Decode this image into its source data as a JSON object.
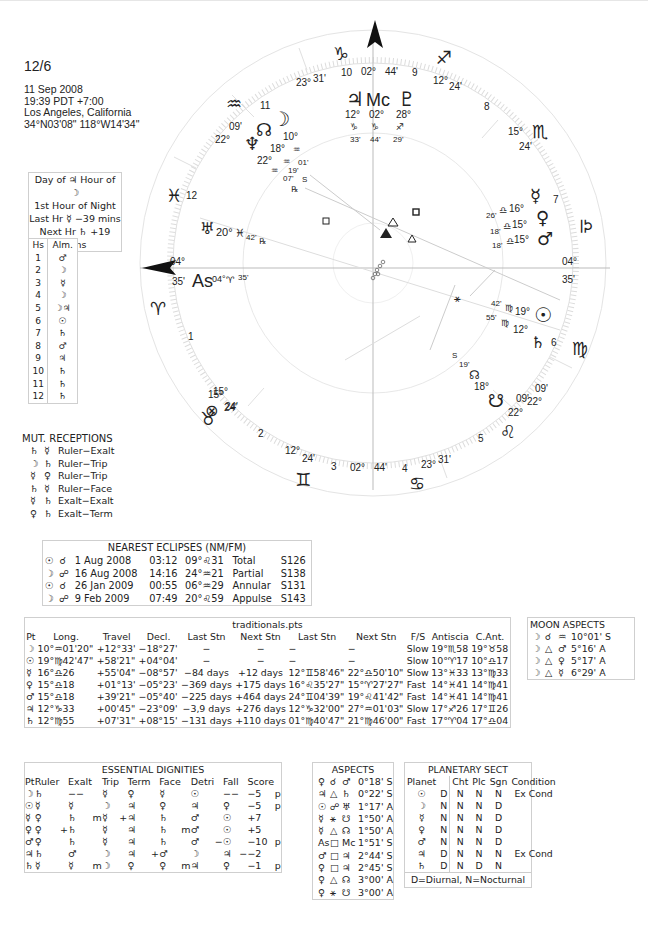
{
  "header": {
    "title": "12/6",
    "date": "11 Sep 2008",
    "time": "19:39  PDT +7:00",
    "place": "Los Angeles, California",
    "coords": "34°N03'08\" 118°W14'34\""
  },
  "planetary_hours": {
    "line1": "Day of ♃  Hour of ☽",
    "line2": "1st Hour of Night",
    "line3": "Last Hr ☿ −39 mins",
    "line4": "Next Hr ♄ +19 mins"
  },
  "almuten": {
    "headers": [
      "Hs",
      "Alm."
    ],
    "rows": [
      [
        "1",
        "♂"
      ],
      [
        "2",
        "☽"
      ],
      [
        "3",
        "☿"
      ],
      [
        "4",
        "☽"
      ],
      [
        "5",
        "☽♃"
      ],
      [
        "6",
        "☉"
      ],
      [
        "7",
        "♄"
      ],
      [
        "8",
        "♂"
      ],
      [
        "9",
        "♃"
      ],
      [
        "10",
        "♄"
      ],
      [
        "11",
        "♄"
      ],
      [
        "12",
        "♄"
      ]
    ]
  },
  "mutual_receptions": {
    "title": "MUT. RECEPTIONS",
    "rows": [
      [
        "♄",
        "☿",
        "Ruler−Exalt"
      ],
      [
        "☽",
        "♄",
        "Ruler−Trip"
      ],
      [
        "☿",
        "♀",
        "Ruler−Trip"
      ],
      [
        "♄",
        "☿",
        "Ruler−Face"
      ],
      [
        "☿",
        "♄",
        "Exalt−Exalt"
      ],
      [
        "♀",
        "♄",
        "Exalt−Term"
      ]
    ]
  },
  "eclipses": {
    "title": "NEAREST ECLIPSES (NM/FM)",
    "rows": [
      [
        "☉",
        "☌",
        "1 Aug 2008",
        "03:12",
        "09°♌31",
        "Total",
        "S126"
      ],
      [
        "☽",
        "☍",
        "16 Aug 2008",
        "14:16",
        "24°♒21",
        "Partial",
        "S138"
      ],
      [
        "☉",
        "☌",
        "26 Jan 2009",
        "00:55",
        "06°♒29",
        "Annular",
        "S131"
      ],
      [
        "☽",
        "☍",
        "9 Feb 2009",
        "07:49",
        "20°♌59",
        "Appulse",
        "S143"
      ]
    ]
  },
  "traditionals": {
    "title": "traditionals.pts",
    "headers": [
      "Pt",
      "Long.",
      "Travel",
      "Decl.",
      "Last Stn",
      "Next Stn",
      "Last Stn",
      "Next Stn",
      "F/S",
      "Antiscia",
      "C.Ant."
    ],
    "rows": [
      [
        "☽",
        "10°♒01'20\"",
        "+12°33'",
        "−18°27'",
        "−",
        "−",
        "−",
        "−",
        "Slow",
        "19°♏58",
        "19°♉58"
      ],
      [
        "☉",
        "19°♍42'47\"",
        "+58'21\"",
        "+04°04'",
        "−",
        "−",
        "−",
        "−",
        "Slow",
        "10°♈17",
        "10°♎17"
      ],
      [
        "☿",
        "16°♎26",
        "+55'04\"",
        "−08°57'",
        "−84 days",
        "+12 days",
        "12°♊58'46\"",
        "22°♎50'10\"",
        "Slow",
        "13°♓33",
        "13°♍33"
      ],
      [
        "♀",
        "15°♎18",
        "+01°13'",
        "−05°23'",
        "−369 days",
        "+175 days",
        "16°♌35'27\"",
        "15°♈27'27\"",
        "Fast",
        "14°♓41",
        "14°♍41"
      ],
      [
        "♂",
        "15°♎18",
        "+39'21\"",
        "−05°40'",
        "−225 days",
        "+464 days",
        "24°♊04'39\"",
        "19°♌41'42\"",
        "Fast",
        "14°♓41",
        "14°♍41"
      ],
      [
        "♃",
        "12°♑33",
        "+00'45\"",
        "−23°09'",
        "−3,9 days",
        "+276 days",
        "12°♑32'00\"",
        "27°♒01'03\"",
        "Slow",
        "17°♐26",
        "17°♊26"
      ],
      [
        "♄",
        "12°♍55",
        "+07'31\"",
        "+08°15'",
        "−131 days",
        "+110 days",
        "01°♍40'47\"",
        "21°♍46'00\"",
        "Fast",
        "17°♈04",
        "17°♎04"
      ]
    ]
  },
  "moon_aspects": {
    "title": "MOON ASPECTS",
    "rows": [
      [
        "☽",
        "☌",
        "♒",
        "10°01' S"
      ],
      [
        "☽",
        "△",
        "♂",
        "5°16' A"
      ],
      [
        "☽",
        "△",
        "♀",
        "5°17' A"
      ],
      [
        "☽",
        "△",
        "☿",
        "6°29' A"
      ]
    ]
  },
  "essential_dignities": {
    "title": "ESSENTIAL DIGNITIES",
    "headers": [
      "Pt",
      "Ruler",
      "",
      "Exalt",
      "",
      "Trip",
      "",
      "Term",
      "",
      "Face",
      "",
      "Detri",
      "",
      "Fall",
      "",
      "Score",
      ""
    ],
    "rows": [
      [
        "☽",
        "♄",
        "",
        "−−",
        "",
        "☿",
        "",
        "♀",
        "",
        "☿",
        "",
        "☉",
        "",
        "−−",
        "",
        "−5",
        "p"
      ],
      [
        "☉",
        "☿",
        "",
        "☿",
        "",
        "☽",
        "",
        "♃",
        "",
        "♀",
        "",
        "♃",
        "",
        "♀",
        "",
        "−5",
        "p"
      ],
      [
        "☿",
        "♀",
        "",
        "♄",
        "m",
        "☿",
        "+",
        "♃",
        "",
        "♄",
        "",
        "♂",
        "",
        "☉",
        "",
        "+7",
        ""
      ],
      [
        "♀",
        "♀",
        "+",
        "♄",
        "",
        "☿",
        "",
        "♃",
        "",
        "♄",
        "m",
        "♂",
        "",
        "☉",
        "",
        "+5",
        ""
      ],
      [
        "♂",
        "♀",
        "",
        "♄",
        "",
        "☿",
        "",
        "♃",
        "",
        "♄",
        "",
        "♂",
        "−",
        "☉",
        "",
        "−10",
        "p"
      ],
      [
        "♃",
        "♄",
        "",
        "♂",
        "",
        "☽",
        "",
        "♃",
        "+",
        "♂",
        "",
        "☽",
        "",
        "♃",
        "−",
        "−2",
        ""
      ],
      [
        "♄",
        "☿",
        "",
        "☿",
        "m",
        "☽",
        "",
        "♀",
        "",
        "♀",
        "m",
        "♃",
        "",
        "♀",
        "",
        "−1",
        "p"
      ]
    ]
  },
  "aspects": {
    "title": "ASPECTS",
    "rows": [
      [
        "♀",
        "☌",
        "♂",
        "0°18' S"
      ],
      [
        "♃",
        "△",
        "♄",
        "0°22' S"
      ],
      [
        "☉",
        "☍",
        "♅",
        "1°17' A"
      ],
      [
        "☿",
        "⚹",
        "☋",
        "1°50' A"
      ],
      [
        "☿",
        "△",
        "☊",
        "1°50' A"
      ],
      [
        "As",
        "□",
        "Mc",
        "1°51' S"
      ],
      [
        "♂",
        "□",
        "♃",
        "2°44' S"
      ],
      [
        "♀",
        "□",
        "♃",
        "2°45' S"
      ],
      [
        "♀",
        "△",
        "☊",
        "3°00' A"
      ],
      [
        "♀",
        "⚹",
        "☋",
        "3°00' A"
      ]
    ]
  },
  "planetary_sect": {
    "title": "PLANETARY SECT",
    "headers": [
      "Planet",
      "",
      "Cht",
      "Plc",
      "Sgn",
      "Condition"
    ],
    "rows": [
      [
        "☉",
        "D",
        "N",
        "N",
        "N",
        "Ex Cond"
      ],
      [
        "☽",
        "N",
        "N",
        "N",
        "D",
        ""
      ],
      [
        "☿",
        "N",
        "N",
        "N",
        "D",
        ""
      ],
      [
        "♀",
        "N",
        "N",
        "N",
        "D",
        ""
      ],
      [
        "♂",
        "N",
        "N",
        "N",
        "D",
        ""
      ],
      [
        "♃",
        "D",
        "N",
        "N",
        "N",
        "Ex Cond"
      ],
      [
        "♄",
        "D",
        "N",
        "D",
        "N",
        ""
      ]
    ],
    "footer": "D=Diurnal, N=Nocturnal"
  },
  "wheel": {
    "cusps": {
      "mc_deg": "02°",
      "mc_min": "44'",
      "ic_deg": "02°",
      "ic_min": "44'",
      "asc_deg": "04°",
      "asc_min": "35'",
      "dsc_deg": "04°",
      "dsc_min": "35'",
      "c11_deg": "23°",
      "c11_min": "31'",
      "c12_deg": "22°",
      "c12_min": "09'",
      "c2_deg": "15°",
      "c2_min": "24'",
      "c3_deg": "12°",
      "c3_min": "24'",
      "c5_deg": "23°",
      "c5_min": "31'",
      "c6_deg": "22°",
      "c6_min": "09'",
      "c8_deg": "15°",
      "c8_min": "24'",
      "c9_deg": "12°",
      "c9_min": "24'"
    },
    "house_numbers": [
      "1",
      "2",
      "3",
      "4",
      "5",
      "6",
      "7",
      "8",
      "9",
      "10",
      "11",
      "12"
    ],
    "signs": {
      "capricorn": "♑",
      "sagittarius": "♐",
      "scorpio": "♏",
      "libra": "♎",
      "virgo": "♍",
      "leo": "♌",
      "cancer": "♋",
      "gemini": "♊",
      "taurus": "♉",
      "aries": "♈",
      "pisces": "♓",
      "aquarius": "♒"
    },
    "planets": {
      "jupiter": {
        "glyph": "♃",
        "deg": "12°",
        "sign": "♑",
        "min": "33'"
      },
      "mc": {
        "glyph": "Mc",
        "deg": "02°",
        "sign": "♑",
        "min": "44'"
      },
      "pluto": {
        "glyph": "♇",
        "deg": "28°",
        "sign": "♐",
        "min": "29'"
      },
      "moon": {
        "glyph": "☽",
        "deg": "10°",
        "sign": "♒",
        "min": "01'",
        "flag": "S"
      },
      "node": {
        "glyph": "☊",
        "deg": "18°",
        "sign": "♒",
        "min": "19'"
      },
      "neptune": {
        "glyph": "♆",
        "deg": "22°",
        "sign": "♒",
        "min": "07'",
        "flag": "℞"
      },
      "uranus": {
        "glyph": "♅",
        "deg": "20°",
        "sign": "♓",
        "min": "42'",
        "flag": "℞"
      },
      "asc": {
        "glyph": "As",
        "deg": "04°",
        "sign": "♈",
        "min": "35'"
      },
      "mercury": {
        "glyph": "☿",
        "deg": "16°",
        "sign": "♎",
        "min": "26'"
      },
      "venus": {
        "glyph": "♀",
        "deg": "15°",
        "sign": "♎",
        "min": "18'"
      },
      "mars": {
        "glyph": "♂",
        "deg": "15°",
        "sign": "♎",
        "min": "18'"
      },
      "sun": {
        "glyph": "☉",
        "deg": "19°",
        "sign": "♍",
        "min": "42'"
      },
      "saturn": {
        "glyph": "♄",
        "deg": "12°",
        "sign": "♍",
        "min": "55'"
      },
      "south_node": {
        "glyph": "☋",
        "deg": "22°",
        "min": "09'"
      },
      "node_s": {
        "glyph": "☊",
        "deg": "18°",
        "min": "19'",
        "flag": "S"
      },
      "fortune": {
        "glyph": "⊗",
        "deg": "15°",
        "min": "24'"
      }
    },
    "aspect_marks": [
      "□",
      "△",
      "□",
      "△"
    ]
  }
}
